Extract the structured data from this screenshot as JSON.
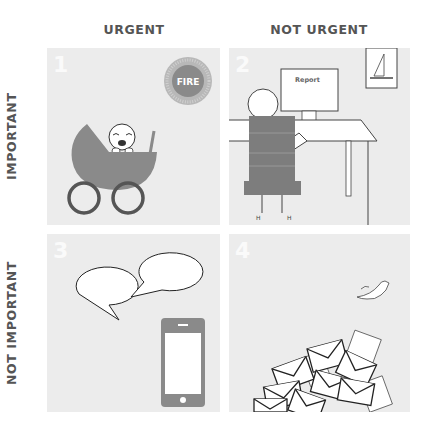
{
  "headers": {
    "columns": [
      "URGENT",
      "NOT URGENT"
    ],
    "rows": [
      "IMPORTANT",
      "NOT IMPORTANT"
    ]
  },
  "quadrants": [
    {
      "number": "1",
      "illustration": "crying-baby-in-stroller-and-fire-badge",
      "badge_text": "FIRE"
    },
    {
      "number": "2",
      "illustration": "person-working-at-desk-computer",
      "screen_text": "Report"
    },
    {
      "number": "3",
      "illustration": "speech-bubbles-and-smartphone"
    },
    {
      "number": "4",
      "illustration": "pile-of-envelopes-and-bird"
    }
  ],
  "colors": {
    "panel": "#ececec",
    "accent": "#8a8a8a",
    "header_text": "#555555",
    "background": "#ffffff"
  }
}
